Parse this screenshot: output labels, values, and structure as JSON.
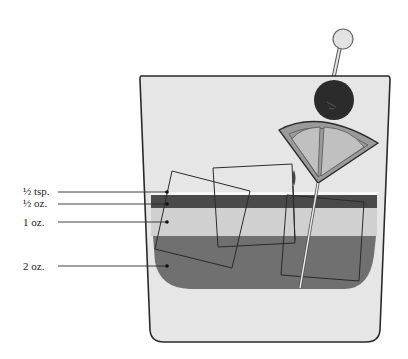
{
  "labels": [
    {
      "text": "½ tsp.",
      "y": 191
    },
    {
      "text": "½ oz.",
      "y": 203
    },
    {
      "text": "1 oz.",
      "y": 222
    },
    {
      "text": "2 oz.",
      "y": 266
    }
  ],
  "colors": {
    "glass_fill": "#e6e6e6",
    "glass_outline": "#2a2a2a",
    "top_layer": "#f4f4f4",
    "dark_layer": "#4a4a4a",
    "light_layer": "#cfcfcf",
    "bottom_layer": "#6f6f6f",
    "olive": "#2b2b2b",
    "citrus_rind": "#9a9a9a",
    "citrus_flesh": "#c0c0c0",
    "pick_head": "#e2e2e2"
  },
  "garnish": {
    "olive": "olive",
    "citrus": "citrus-wedge",
    "pick": "cocktail-pick"
  }
}
